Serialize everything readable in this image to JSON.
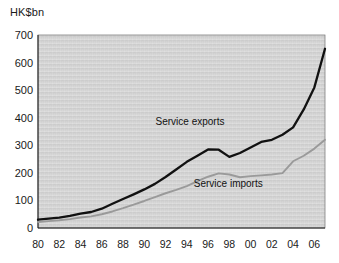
{
  "chart_data": {
    "type": "line",
    "title": "",
    "subtitle": "",
    "xlabel": "",
    "ylabel": "HK$bn",
    "unit_label": "HK$bn",
    "grid": false,
    "legend_position": "inline-annotations",
    "xlim": [
      1980,
      2007
    ],
    "ylim": [
      0,
      700
    ],
    "yticks": [
      0,
      100,
      200,
      300,
      400,
      500,
      600,
      700
    ],
    "ytick_labels": [
      "0",
      "100",
      "200",
      "300",
      "400",
      "500",
      "600",
      "700"
    ],
    "x": [
      1980,
      1981,
      1982,
      1983,
      1984,
      1985,
      1986,
      1987,
      1988,
      1989,
      1990,
      1991,
      1992,
      1993,
      1994,
      1995,
      1996,
      1997,
      1998,
      1999,
      2000,
      2001,
      2002,
      2003,
      2004,
      2005,
      2006,
      2007
    ],
    "xtick_values": [
      1980,
      1982,
      1984,
      1986,
      1988,
      1990,
      1992,
      1994,
      1996,
      1998,
      2000,
      2002,
      2004,
      2006
    ],
    "xtick_labels": [
      "80",
      "82",
      "84",
      "86",
      "88",
      "90",
      "92",
      "94",
      "96",
      "98",
      "00",
      "02",
      "04",
      "06"
    ],
    "series": [
      {
        "name": "Service exports",
        "color": "#111111",
        "line_width": 2.3,
        "values": [
          30,
          34,
          38,
          44,
          52,
          58,
          70,
          88,
          105,
          122,
          140,
          160,
          185,
          212,
          240,
          262,
          285,
          284,
          258,
          272,
          292,
          312,
          320,
          338,
          365,
          430,
          510,
          650
        ]
      },
      {
        "name": "Service imports",
        "color": "#9a9a9a",
        "line_width": 1.9,
        "values": [
          22,
          25,
          28,
          32,
          38,
          42,
          50,
          60,
          72,
          85,
          98,
          112,
          126,
          138,
          152,
          170,
          186,
          198,
          194,
          184,
          188,
          191,
          194,
          199,
          242,
          262,
          288,
          320
        ]
      }
    ],
    "annotations": [
      {
        "text": "Service exports",
        "x": 1994.3,
        "y": 375
      },
      {
        "text": "Service imports",
        "x": 1997.9,
        "y": 148
      }
    ],
    "colors": {
      "plot_background": "#cfcfcf",
      "page_background": "#ffffff",
      "axis": "#1a1a1a",
      "exports_line": "#111111",
      "imports_line": "#9a9a9a",
      "text": "#1a1a1a"
    }
  }
}
